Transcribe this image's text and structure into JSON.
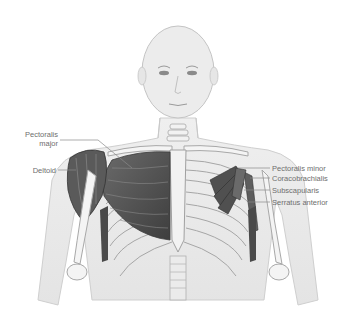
{
  "diagram": {
    "labels_left": [
      {
        "id": "pectoralis-major",
        "line1": "Pectoralis",
        "line2": "major"
      },
      {
        "id": "deltoid",
        "line1": "Deltoid"
      }
    ],
    "labels_right": [
      {
        "id": "pectoralis-minor",
        "text": "Pectoralis minor"
      },
      {
        "id": "coracobrachialis",
        "text": "Coracobrachialis"
      },
      {
        "id": "subscapularis",
        "text": "Subscapularis"
      },
      {
        "id": "serratus-anterior",
        "text": "Serratus anterior"
      }
    ],
    "colors": {
      "skin": "#ececec",
      "skin_outline": "#c8c8c8",
      "bone": "#f4f4f4",
      "bone_outline": "#a8a8a8",
      "muscle": "#4a4a4a",
      "muscle_light": "#7a7a7a",
      "leader_line": "#8a8a8a",
      "label_text": "#6e6e6e"
    }
  }
}
